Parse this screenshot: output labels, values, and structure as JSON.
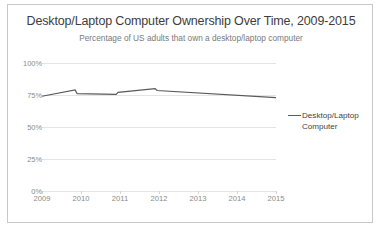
{
  "chart_data": {
    "type": "line",
    "title": "Desktop/Laptop Computer Ownership Over Time, 2009-2015",
    "subtitle": "Percentage of US adults that own a desktop/laptop computer",
    "xlabel": "",
    "ylabel": "",
    "ylim": [
      0,
      100
    ],
    "xlim": [
      2009,
      2015
    ],
    "grid": true,
    "legend_position": "right",
    "ytick_labels": [
      "0%",
      "25%",
      "50%",
      "75%",
      "100%"
    ],
    "ytick_values": [
      0,
      25,
      50,
      75,
      100
    ],
    "xtick_labels": [
      "2009",
      "2010",
      "2011",
      "2012",
      "2013",
      "2014",
      "2015"
    ],
    "xtick_values": [
      2009,
      2010,
      2011,
      2012,
      2013,
      2014,
      2015
    ],
    "series": [
      {
        "name": "Desktop/Laptop Computer",
        "color": "#595959",
        "x": [
          2009.0,
          2009.85,
          2009.9,
          2010.9,
          2010.95,
          2011.9,
          2011.95,
          2015.0
        ],
        "values": [
          74,
          79,
          76,
          75.5,
          77,
          80,
          78.5,
          73
        ]
      }
    ]
  },
  "legend": {
    "entries": [
      {
        "label": "Desktop/Laptop Computer",
        "color": "#595959"
      }
    ]
  }
}
